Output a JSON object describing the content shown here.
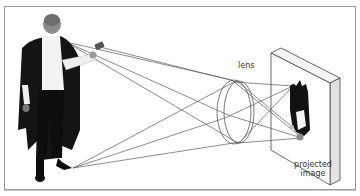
{
  "diagram": {
    "labels": {
      "lens": "lens",
      "projected_image_line1": "projected",
      "projected_image_line2": "image"
    },
    "elements": [
      {
        "id": "person",
        "description": "Man in dark cape and white shirt holding a torch-like object"
      },
      {
        "id": "rays",
        "description": "Light rays from head/hand and feet passing through lens"
      },
      {
        "id": "lens",
        "description": "Convex lens drawn as double ellipse"
      },
      {
        "id": "screen",
        "description": "Projection screen shown in perspective"
      },
      {
        "id": "projected-image",
        "description": "Inverted image of the person on the screen"
      }
    ],
    "colors": {
      "ray": "#555555",
      "outline": "#444444",
      "cape": "#111111",
      "shirt": "#f2f2f2",
      "frame": "#9a9a9a"
    }
  }
}
